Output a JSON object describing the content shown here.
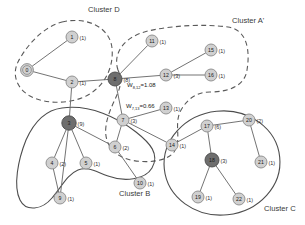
{
  "figure": {
    "type": "graph-diagram",
    "background": "#ffffff",
    "width": 305,
    "height": 225
  },
  "palette": {
    "node_light_fill": "#d0d0d0",
    "node_light_stroke": "#8a8a8a",
    "node_dark_fill": "#6e6e6e",
    "node_dark_stroke": "#4a4a4a",
    "edge_stroke": "#6b6b6b",
    "cluster_solid_stroke": "#4d4d4d",
    "cluster_dashed_stroke": "#5a5a5a",
    "text": "#222222"
  },
  "clusters": [
    {
      "id": "D",
      "label": "Cluster D",
      "style": "dashed",
      "label_x": 88,
      "label_y": 12
    },
    {
      "id": "A1",
      "label": "Cluster A'",
      "style": "dashed",
      "label_x": 232,
      "label_y": 23
    },
    {
      "id": "B",
      "label": "Cluster B",
      "style": "solid",
      "label_x": 119,
      "label_y": 196
    },
    {
      "id": "C",
      "label": "Cluster C",
      "style": "solid",
      "label_x": 264,
      "label_y": 211
    }
  ],
  "nodes": [
    {
      "id": "0",
      "label": "0",
      "count": "",
      "x": 27,
      "y": 70,
      "shade": "ring",
      "r": 6.4
    },
    {
      "id": "1",
      "label": "1",
      "count": "(1)",
      "x": 72,
      "y": 37,
      "shade": "light",
      "r": 6.0
    },
    {
      "id": "2",
      "label": "2",
      "count": "(1)",
      "x": 72,
      "y": 82,
      "shade": "light",
      "r": 6.0
    },
    {
      "id": "3",
      "label": "3",
      "count": "(9)",
      "x": 69,
      "y": 123,
      "shade": "dark",
      "r": 7.2
    },
    {
      "id": "4",
      "label": "4",
      "count": "(2)",
      "x": 52,
      "y": 163,
      "shade": "light",
      "r": 6.0
    },
    {
      "id": "5",
      "label": "5",
      "count": "(1)",
      "x": 86,
      "y": 163,
      "shade": "light",
      "r": 6.0
    },
    {
      "id": "6",
      "label": "6",
      "count": "(2)",
      "x": 115,
      "y": 147,
      "shade": "light",
      "r": 6.0
    },
    {
      "id": "7",
      "label": "7",
      "count": "(3)",
      "x": 123,
      "y": 120,
      "shade": "light",
      "r": 6.0
    },
    {
      "id": "8",
      "label": "8",
      "count": "(8)",
      "x": 115,
      "y": 79,
      "shade": "dark",
      "r": 7.0
    },
    {
      "id": "9",
      "label": "9",
      "count": "(1)",
      "x": 60,
      "y": 198,
      "shade": "light",
      "r": 6.0
    },
    {
      "id": "10",
      "label": "10",
      "count": "(1)",
      "x": 140,
      "y": 183,
      "shade": "light",
      "r": 6.0
    },
    {
      "id": "11",
      "label": "11",
      "count": "(1)",
      "x": 152,
      "y": 41,
      "shade": "light",
      "r": 6.0
    },
    {
      "id": "12",
      "label": "12",
      "count": "(3)",
      "x": 166,
      "y": 75,
      "shade": "light",
      "r": 6.0
    },
    {
      "id": "13",
      "label": "13",
      "count": "(1)",
      "x": 166,
      "y": 108,
      "shade": "light",
      "r": 6.0
    },
    {
      "id": "14",
      "label": "14",
      "count": "(1)",
      "x": 172,
      "y": 145,
      "shade": "light",
      "r": 6.0
    },
    {
      "id": "15",
      "label": "15",
      "count": "(1)",
      "x": 211,
      "y": 50,
      "shade": "light",
      "r": 6.0
    },
    {
      "id": "16",
      "label": "16",
      "count": "(1)",
      "x": 211,
      "y": 75,
      "shade": "light",
      "r": 6.0
    },
    {
      "id": "17",
      "label": "17",
      "count": "(6)",
      "x": 207,
      "y": 126,
      "shade": "light",
      "r": 6.0
    },
    {
      "id": "18",
      "label": "18",
      "count": "(3)",
      "x": 212,
      "y": 160,
      "shade": "dark",
      "r": 7.0
    },
    {
      "id": "19",
      "label": "19",
      "count": "(1)",
      "x": 198,
      "y": 197,
      "shade": "light",
      "r": 6.0
    },
    {
      "id": "20",
      "label": "20",
      "count": "(2)",
      "x": 249,
      "y": 120,
      "shade": "light",
      "r": 6.0
    },
    {
      "id": "21",
      "label": "21",
      "count": "(1)",
      "x": 261,
      "y": 162,
      "shade": "light",
      "r": 6.0
    },
    {
      "id": "22",
      "label": "22",
      "count": "(1)",
      "x": 239,
      "y": 199,
      "shade": "light",
      "r": 6.0
    }
  ],
  "edges": [
    {
      "from": "0",
      "to": "1"
    },
    {
      "from": "0",
      "to": "2"
    },
    {
      "from": "2",
      "to": "8"
    },
    {
      "from": "2",
      "to": "3"
    },
    {
      "from": "8",
      "to": "11"
    },
    {
      "from": "8",
      "to": "12"
    },
    {
      "from": "8",
      "to": "7"
    },
    {
      "from": "12",
      "to": "15"
    },
    {
      "from": "12",
      "to": "16"
    },
    {
      "from": "7",
      "to": "13"
    },
    {
      "from": "7",
      "to": "14"
    },
    {
      "from": "7",
      "to": "6"
    },
    {
      "from": "3",
      "to": "4"
    },
    {
      "from": "3",
      "to": "5"
    },
    {
      "from": "3",
      "to": "6"
    },
    {
      "from": "3",
      "to": "9"
    },
    {
      "from": "4",
      "to": "9"
    },
    {
      "from": "6",
      "to": "10"
    },
    {
      "from": "14",
      "to": "17"
    },
    {
      "from": "17",
      "to": "20"
    },
    {
      "from": "17",
      "to": "18"
    },
    {
      "from": "20",
      "to": "21"
    },
    {
      "from": "18",
      "to": "19"
    },
    {
      "from": "18",
      "to": "22"
    }
  ],
  "edge_weights": [
    {
      "id": "w-8-12",
      "text": "=1.08",
      "prefix": "W",
      "sub": "8,12",
      "x": 127,
      "y": 87
    },
    {
      "id": "w-7-13",
      "text": "=0.66",
      "prefix": "W",
      "sub": "7,13",
      "x": 126,
      "y": 108
    }
  ]
}
